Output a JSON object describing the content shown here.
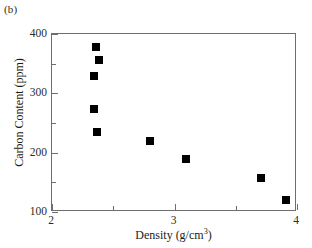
{
  "panel": {
    "label": "(b)"
  },
  "chart_data": {
    "type": "scatter",
    "title": "",
    "xlabel": "Density (g/cm",
    "xlabel_exponent": "3",
    "xlabel_suffix": ")",
    "ylabel": "Carbon Content (ppm)",
    "xlim": [
      2,
      4
    ],
    "ylim": [
      100,
      400
    ],
    "grid": false,
    "legend": null,
    "marker_style": "filled-square",
    "marker_color": "#000000",
    "xticks": [
      2,
      3,
      4
    ],
    "xtick_labels": [
      "2",
      "3",
      "4"
    ],
    "xminor_ticks": [
      2.5,
      3.5
    ],
    "yticks": [
      100,
      200,
      300,
      400
    ],
    "ytick_labels": [
      "100",
      "200",
      "300",
      "400"
    ],
    "yminor_ticks": [
      150,
      250,
      350
    ],
    "x": [
      2.36,
      2.38,
      2.34,
      2.34,
      2.37,
      2.8,
      3.09,
      3.71,
      3.91
    ],
    "y": [
      378,
      356,
      330,
      273,
      234,
      220,
      190,
      158,
      120
    ],
    "points": [
      {
        "x": 2.36,
        "y": 378
      },
      {
        "x": 2.38,
        "y": 356
      },
      {
        "x": 2.34,
        "y": 330
      },
      {
        "x": 2.34,
        "y": 273
      },
      {
        "x": 2.37,
        "y": 234
      },
      {
        "x": 2.8,
        "y": 220
      },
      {
        "x": 3.09,
        "y": 190
      },
      {
        "x": 3.71,
        "y": 158
      },
      {
        "x": 3.91,
        "y": 120
      }
    ]
  },
  "colors": {
    "axis": "#6e6e6e",
    "marker": "#000000",
    "text": "#1a1a1a",
    "background": "#ffffff"
  }
}
